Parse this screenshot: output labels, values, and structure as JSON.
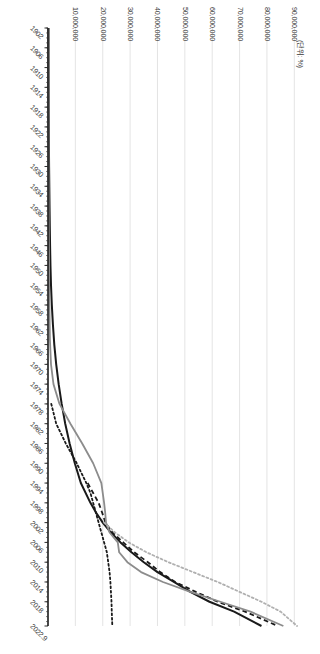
{
  "chart_data": {
    "type": "line",
    "title": "",
    "subtitle": "",
    "xlabel": "",
    "ylabel": "",
    "unit_label": "(단위: %)",
    "grid": true,
    "grid_axis": "y",
    "legend": "none",
    "xlim": [
      1902,
      2022.9
    ],
    "ylim": [
      0,
      95000000
    ],
    "x_tick_labels": [
      "1902",
      "1906",
      "1910",
      "1914",
      "1918",
      "1922",
      "1926",
      "1930",
      "1934",
      "1938",
      "1942",
      "1946",
      "1950",
      "1954",
      "1958",
      "1962",
      "1966",
      "1970",
      "1974",
      "1978",
      "1982",
      "1986",
      "1990",
      "1994",
      "1998",
      "2002",
      "2006",
      "2010",
      "2014",
      "2018",
      "2022.9"
    ],
    "y_tick_labels": [
      "10,000,000",
      "20,000,000",
      "30,000,000",
      "40,000,000",
      "50,000,000",
      "60,000,000",
      "70,000,000",
      "80,000,000",
      "90,000,000"
    ],
    "y_tick_values": [
      10000000,
      20000000,
      30000000,
      40000000,
      50000000,
      60000000,
      70000000,
      80000000,
      90000000
    ],
    "series": [
      {
        "name": "series-1",
        "style": "solid",
        "color": "#1a1a1a",
        "width": 2.0,
        "x": [
          1902,
          1906,
          1910,
          1914,
          1918,
          1922,
          1926,
          1930,
          1934,
          1938,
          1942,
          1946,
          1950,
          1954,
          1958,
          1962,
          1966,
          1970,
          1974,
          1978,
          1982,
          1986,
          1990,
          1994,
          1998,
          2000,
          2002,
          2004,
          2006,
          2008,
          2010,
          2012,
          2014,
          2016,
          2018,
          2020,
          2022.9
        ],
        "y": [
          200000,
          210000,
          220000,
          240000,
          260000,
          300000,
          340000,
          400000,
          480000,
          560000,
          650000,
          760000,
          900000,
          1100000,
          1400000,
          1800000,
          2300000,
          3000000,
          3900000,
          5000000,
          6300000,
          7900000,
          9800000,
          12000000,
          15500000,
          17600000,
          20000000,
          23000000,
          26500000,
          30500000,
          35000000,
          40000000,
          46000000,
          52000000,
          59000000,
          68000000,
          78000000
        ]
      },
      {
        "name": "series-2",
        "style": "dashed",
        "color": "#1a1a1a",
        "width": 1.8,
        "x": [
          1994,
          1996,
          1998,
          2000,
          2002,
          2004,
          2006,
          2008,
          2010,
          2012,
          2014,
          2016,
          2018,
          2020,
          2022.9
        ],
        "y": [
          14500000,
          16500000,
          18500000,
          19800000,
          21000000,
          23500000,
          27500000,
          31500000,
          36500000,
          41000000,
          46500000,
          54000000,
          62000000,
          72000000,
          84000000
        ]
      },
      {
        "name": "series-3",
        "style": "dotted",
        "color": "#1a1a1a",
        "width": 1.8,
        "x": [
          1978,
          1982,
          1986,
          1990,
          1994,
          1996,
          1998,
          2000,
          2002,
          2004,
          2006,
          2008,
          2010,
          2012,
          2014,
          2016,
          2018,
          2020,
          2022.9
        ],
        "y": [
          1200000,
          3000000,
          6500000,
          10500000,
          14000000,
          15500000,
          16500000,
          17500000,
          18500000,
          19500000,
          20500000,
          21500000,
          22000000,
          22500000,
          22800000,
          23000000,
          23200000,
          23300000,
          23500000
        ]
      },
      {
        "name": "series-4",
        "style": "solid",
        "color": "#8c8c8c",
        "width": 1.8,
        "x": [
          1902,
          1920,
          1940,
          1955,
          1965,
          1970,
          1974,
          1978,
          1982,
          1986,
          1990,
          1994,
          1998,
          2000,
          2002,
          2004,
          2006,
          2008,
          2010,
          2012,
          2014,
          2016,
          2018,
          2020,
          2022.9
        ],
        "y": [
          150000,
          180000,
          260000,
          420000,
          700000,
          1100000,
          2000000,
          4200000,
          8200000,
          12500000,
          16500000,
          19500000,
          20500000,
          20900000,
          21200000,
          22500000,
          25500000,
          26000000,
          29000000,
          34000000,
          42000000,
          52000000,
          63000000,
          74000000,
          86000000
        ]
      },
      {
        "name": "series-5",
        "style": "dotted",
        "color": "#b0b0b0",
        "width": 1.8,
        "x": [
          2002,
          2004,
          2006,
          2008,
          2010,
          2012,
          2014,
          2016,
          2018,
          2020,
          2022.9
        ],
        "y": [
          20500000,
          24500000,
          29500000,
          36000000,
          44000000,
          53000000,
          62000000,
          70000000,
          78000000,
          85000000,
          91000000
        ]
      }
    ]
  },
  "figure": {
    "background_color": "#ffffff",
    "grid_color": "#d9d9d9",
    "axis_color": "#1a1a1a",
    "tick_label_color": "#3a3a3a"
  }
}
